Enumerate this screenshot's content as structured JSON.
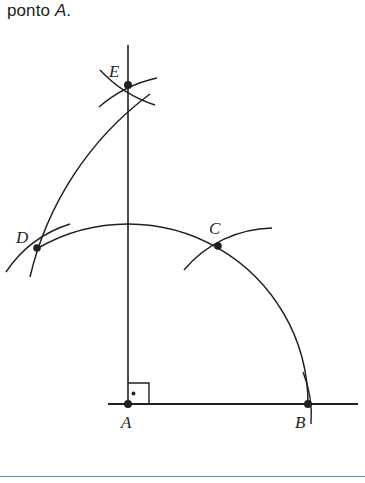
{
  "caption": {
    "prefix": "ponto ",
    "italic_point": "A",
    "suffix": "."
  },
  "figure": {
    "stroke_color": "#231f20",
    "accent_rule_color": "#5b87c5",
    "points": [
      {
        "id": "A",
        "label": "A",
        "x": 128,
        "y": 404,
        "label_x": 121,
        "label_y": 426
      },
      {
        "id": "B",
        "label": "B",
        "x": 308,
        "y": 404,
        "label_x": 296,
        "label_y": 426
      },
      {
        "id": "C",
        "label": "C",
        "x": 218,
        "y": 246,
        "label_x": 210,
        "label_y": 232
      },
      {
        "id": "D",
        "label": "D",
        "x": 37,
        "y": 248,
        "label_x": 18,
        "label_y": 241
      },
      {
        "id": "E",
        "label": "E",
        "x": 128,
        "y": 85,
        "label_x": 110,
        "label_y": 75
      }
    ],
    "lines": [
      {
        "name": "baseline-horizontal",
        "x1": 108,
        "y1": 404,
        "x2": 358,
        "y2": 404
      },
      {
        "name": "perpendicular-vertical",
        "x1": 128,
        "y1": 45,
        "x2": 128,
        "y2": 404
      }
    ],
    "right_angle": {
      "name": "right-angle-marker-at-A",
      "x": 128,
      "y": 404,
      "size": 21,
      "dot_radius": 1.8
    },
    "arcs": [
      {
        "name": "main-arc-D-C-B",
        "center": "A",
        "radius": 180,
        "start_deg": 240,
        "end_deg": 360
      },
      {
        "name": "arc-from-B-through-D-to-E",
        "center": "B",
        "radius": 318,
        "start_deg": 180,
        "end_deg": 236
      },
      {
        "name": "tick-arc-at-B",
        "cx": 308,
        "cy": 404,
        "r": 180
      },
      {
        "name": "tick-arc-at-C-from-B",
        "cx": 308,
        "cy": 404,
        "r": 180
      },
      {
        "name": "tick-arc-at-D-from-A",
        "cx": 128,
        "cy": 404,
        "r": 180
      },
      {
        "name": "tick-arc-at-E-from-C",
        "cx": 218,
        "cy": 246,
        "r": 180
      },
      {
        "name": "tick-arc-at-E-from-D",
        "cx": 37,
        "cy": 248,
        "r": 180
      }
    ],
    "point_dot_radius": 3.6,
    "stroke_width": 1.5
  },
  "footer": {
    "rule_label": "section-divider"
  }
}
